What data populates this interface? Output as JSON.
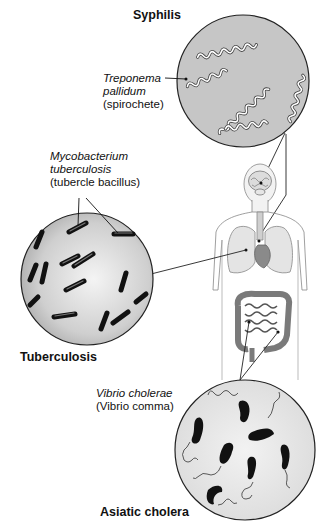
{
  "diagram": {
    "panels": [
      {
        "disease": "Syphilis",
        "organism_name_line1": "Treponema",
        "organism_name_line2": "pallidum",
        "organism_common": "(spirochete)",
        "body_site": "brain / nervous system"
      },
      {
        "disease": "Tuberculosis",
        "organism_name_line1": "Mycobacterium",
        "organism_name_line2": "tuberculosis",
        "organism_common": "(tubercle bacillus)",
        "body_site": "lungs"
      },
      {
        "disease": "Asiatic cholera",
        "organism_name_line1": "Vibrio cholerae",
        "organism_common": "(Vibrio comma)",
        "body_site": "intestines"
      }
    ],
    "center_figure": "human-torso-anatomy",
    "colors": {
      "circle_fill_syphilis": "#c4c4c4",
      "circle_fill_tb": "#d8d8d8",
      "circle_fill_cholera": "#e6e6e6",
      "outline": "#222222",
      "bacterium": "#1a1a1a"
    }
  }
}
